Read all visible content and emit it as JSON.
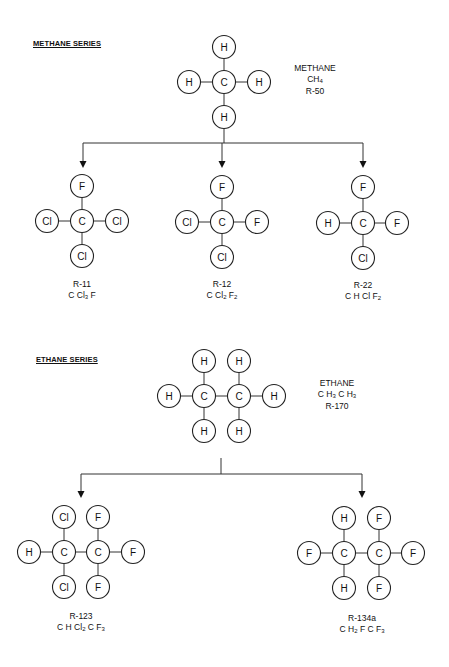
{
  "sections": {
    "methane": {
      "title": "METHANE SERIES",
      "parent": {
        "name": "METHANE",
        "formula_html": "CH<sub>4</sub>",
        "code": "R-50"
      },
      "children": [
        {
          "code": "R-11",
          "formula_html": "C Cl<sub>3</sub> F",
          "atoms": {
            "top": "F",
            "left": "Cl",
            "right": "Cl",
            "bottom": "Cl"
          }
        },
        {
          "code": "R-12",
          "formula_html": "C Cl<sub>2</sub> F<sub>2</sub>",
          "atoms": {
            "top": "F",
            "left": "Cl",
            "right": "F",
            "bottom": "Cl"
          }
        },
        {
          "code": "R-22",
          "formula_html": "C H Cl F<sub>2</sub>",
          "atoms": {
            "top": "F",
            "left": "H",
            "right": "F",
            "bottom": "Cl"
          }
        }
      ]
    },
    "ethane": {
      "title": "ETHANE SERIES",
      "parent": {
        "name": "ETHANE",
        "formula_html": "C H<sub>3</sub> C H<sub>3</sub>",
        "code": "R-170"
      },
      "children": [
        {
          "code": "R-123",
          "formula_html": "C H Cl<sub>2</sub> C F<sub>3</sub>"
        },
        {
          "code": "R-134a",
          "formula_html": "C H<sub>2</sub> F C F<sub>3</sub>"
        }
      ]
    }
  },
  "molecules": [
    {
      "id": "methane",
      "atoms": [
        {
          "el": "C",
          "x": 224,
          "y": 82
        },
        {
          "el": "H",
          "x": 224,
          "y": 47
        },
        {
          "el": "H",
          "x": 189,
          "y": 82
        },
        {
          "el": "H",
          "x": 259,
          "y": 82
        },
        {
          "el": "H",
          "x": 224,
          "y": 117
        }
      ],
      "bonds": [
        [
          0,
          1
        ],
        [
          0,
          2
        ],
        [
          0,
          3
        ],
        [
          0,
          4
        ]
      ]
    },
    {
      "id": "r11",
      "atoms": [
        {
          "el": "C",
          "x": 82,
          "y": 221
        },
        {
          "el": "F",
          "x": 82,
          "y": 186
        },
        {
          "el": "Cl",
          "x": 47,
          "y": 221
        },
        {
          "el": "Cl",
          "x": 117,
          "y": 221
        },
        {
          "el": "Cl",
          "x": 82,
          "y": 256
        }
      ],
      "bonds": [
        [
          0,
          1
        ],
        [
          0,
          2
        ],
        [
          0,
          3
        ],
        [
          0,
          4
        ]
      ]
    },
    {
      "id": "r12",
      "atoms": [
        {
          "el": "C",
          "x": 222,
          "y": 222
        },
        {
          "el": "F",
          "x": 222,
          "y": 187
        },
        {
          "el": "Cl",
          "x": 187,
          "y": 222
        },
        {
          "el": "F",
          "x": 257,
          "y": 222
        },
        {
          "el": "Cl",
          "x": 222,
          "y": 257
        }
      ],
      "bonds": [
        [
          0,
          1
        ],
        [
          0,
          2
        ],
        [
          0,
          3
        ],
        [
          0,
          4
        ]
      ]
    },
    {
      "id": "r22",
      "atoms": [
        {
          "el": "C",
          "x": 363,
          "y": 223
        },
        {
          "el": "F",
          "x": 363,
          "y": 187
        },
        {
          "el": "H",
          "x": 328,
          "y": 223
        },
        {
          "el": "F",
          "x": 397,
          "y": 223
        },
        {
          "el": "Cl",
          "x": 363,
          "y": 258
        }
      ],
      "bonds": [
        [
          0,
          1
        ],
        [
          0,
          2
        ],
        [
          0,
          3
        ],
        [
          0,
          4
        ]
      ]
    },
    {
      "id": "ethane",
      "atoms": [
        {
          "el": "C",
          "x": 204,
          "y": 396
        },
        {
          "el": "C",
          "x": 239,
          "y": 396
        },
        {
          "el": "H",
          "x": 204,
          "y": 361
        },
        {
          "el": "H",
          "x": 239,
          "y": 361
        },
        {
          "el": "H",
          "x": 169,
          "y": 396
        },
        {
          "el": "H",
          "x": 274,
          "y": 396
        },
        {
          "el": "H",
          "x": 204,
          "y": 431
        },
        {
          "el": "H",
          "x": 239,
          "y": 431
        }
      ],
      "bonds": [
        [
          0,
          1
        ],
        [
          0,
          2
        ],
        [
          1,
          3
        ],
        [
          0,
          4
        ],
        [
          1,
          5
        ],
        [
          0,
          6
        ],
        [
          1,
          7
        ]
      ]
    },
    {
      "id": "r123",
      "atoms": [
        {
          "el": "C",
          "x": 64,
          "y": 552
        },
        {
          "el": "C",
          "x": 98,
          "y": 552
        },
        {
          "el": "Cl",
          "x": 64,
          "y": 517
        },
        {
          "el": "F",
          "x": 98,
          "y": 517
        },
        {
          "el": "H",
          "x": 29,
          "y": 552
        },
        {
          "el": "F",
          "x": 133,
          "y": 552
        },
        {
          "el": "Cl",
          "x": 64,
          "y": 587
        },
        {
          "el": "F",
          "x": 98,
          "y": 587
        }
      ],
      "bonds": [
        [
          0,
          1
        ],
        [
          0,
          2
        ],
        [
          1,
          3
        ],
        [
          0,
          4
        ],
        [
          1,
          5
        ],
        [
          0,
          6
        ],
        [
          1,
          7
        ]
      ]
    },
    {
      "id": "r134a",
      "atoms": [
        {
          "el": "C",
          "x": 344,
          "y": 553
        },
        {
          "el": "C",
          "x": 379,
          "y": 553
        },
        {
          "el": "H",
          "x": 344,
          "y": 518
        },
        {
          "el": "F",
          "x": 379,
          "y": 518
        },
        {
          "el": "F",
          "x": 309,
          "y": 553
        },
        {
          "el": "F",
          "x": 413,
          "y": 553
        },
        {
          "el": "H",
          "x": 344,
          "y": 588
        },
        {
          "el": "F",
          "x": 379,
          "y": 588
        }
      ],
      "bonds": [
        [
          0,
          1
        ],
        [
          0,
          2
        ],
        [
          1,
          3
        ],
        [
          0,
          4
        ],
        [
          1,
          5
        ],
        [
          0,
          6
        ],
        [
          1,
          7
        ]
      ]
    }
  ],
  "connectors": [
    {
      "id": "methane-branch",
      "stem": [
        224,
        129,
        224,
        143
      ],
      "bar": [
        83,
        143,
        363,
        143
      ],
      "drops": [
        [
          83,
          143,
          83,
          168
        ],
        [
          222,
          143,
          222,
          168
        ],
        [
          363,
          143,
          363,
          168
        ]
      ]
    },
    {
      "id": "ethane-branch",
      "stem": [
        221,
        458,
        221,
        474
      ],
      "bar": [
        81,
        474,
        362,
        474
      ],
      "drops": [
        [
          81,
          474,
          81,
          498
        ],
        [
          362,
          474,
          362,
          498
        ]
      ]
    }
  ],
  "atom_radius": 11.5
}
